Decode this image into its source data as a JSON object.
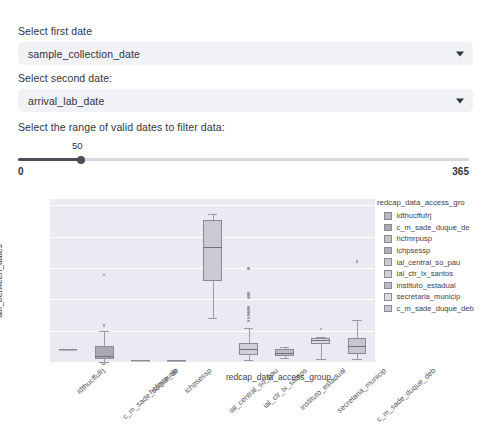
{
  "controls": {
    "first_date": {
      "label": "Select first date",
      "value": "sample_collection_date",
      "chevron_icon": "chevron-down-icon"
    },
    "second_date": {
      "label": "Select second date:",
      "value": "arrival_lab_date",
      "chevron_icon": "chevron-down-icon"
    },
    "range": {
      "label": "Select the range of valid dates to filter data:",
      "value": "50",
      "min": "0",
      "max": "365"
    }
  },
  "chart_data": {
    "type": "box",
    "title": "",
    "xlabel": "redcap_data_access_group",
    "ylabel": "diff_between_dates",
    "ylim": [
      0,
      52
    ],
    "yticks": [
      0,
      10,
      20,
      30,
      40,
      50
    ],
    "grid": true,
    "legend_title": "redcap_data_access_gro",
    "legend_position": "right",
    "categories": [
      "idthucffufrj",
      "c_m_sade_duque_de",
      "hcfmrpusp",
      "ichpsessp",
      "ial_central_so_pau",
      "ial_ctr_lx_santos",
      "instituto_estadual",
      "secretaria_municip",
      "c_m_sade_duque_deb"
    ],
    "boxes": [
      {
        "label": "idthucffufrj",
        "q1": 4.0,
        "median": 4.0,
        "q3": 4.0,
        "whisker_low": 4.0,
        "whisker_high": 4.0,
        "fliers": [],
        "color": "#b8b8c2"
      },
      {
        "label": "c_m_sade_duque_de",
        "q1": 0.8,
        "median": 2.0,
        "q3": 5.0,
        "whisker_low": 0.0,
        "whisker_high": 10.0,
        "fliers": [
          11.7,
          27.8
        ],
        "color": "#a9a9b4"
      },
      {
        "label": "hcfmrpusp",
        "q1": 0.5,
        "median": 0.5,
        "q3": 0.5,
        "whisker_low": 0.5,
        "whisker_high": 0.5,
        "fliers": [],
        "color": "#c2c2cb"
      },
      {
        "label": "ichpsessp",
        "q1": 0.5,
        "median": 0.5,
        "q3": 0.5,
        "whisker_low": 0.5,
        "whisker_high": 0.5,
        "fliers": [],
        "color": "#b0b0bb"
      },
      {
        "label": "ial_central_so_pau",
        "q1": 25.8,
        "median": 36.8,
        "q3": 45.2,
        "whisker_low": 14.0,
        "whisker_high": 47.3,
        "fliers": [],
        "color": "#cacad2"
      },
      {
        "label": "ial_ctr_lx_santos",
        "q1": 2.2,
        "median": 4.0,
        "q3": 6.0,
        "whisker_low": 0.5,
        "whisker_high": 11.0,
        "fliers": [
          13.0,
          14.0,
          15.0,
          15.8,
          16.6,
          17.4,
          20.5,
          21.2,
          21.9,
          29.8
        ],
        "color": "#d0d0d8"
      },
      {
        "label": "instituto_estadual",
        "q1": 2.0,
        "median": 3.0,
        "q3": 4.2,
        "whisker_low": 1.2,
        "whisker_high": 4.8,
        "fliers": [],
        "color": "#bcbcc6"
      },
      {
        "label": "secretaria_municip",
        "q1": 5.8,
        "median": 7.0,
        "q3": 7.6,
        "whisker_low": 1.0,
        "whisker_high": 8.0,
        "fliers": [
          10.5
        ],
        "color": "#dcdce2"
      },
      {
        "label": "c_m_sade_duque_deb",
        "q1": 2.6,
        "median": 5.0,
        "q3": 7.8,
        "whisker_low": 0.8,
        "whisker_high": 13.5,
        "fliers": [
          32.0
        ],
        "color": "#c6c6ce"
      }
    ],
    "legend_entries": [
      {
        "label": "idthucffufrj",
        "color": "#b8b8c2"
      },
      {
        "label": "c_m_sade_duque_de",
        "color": "#a9a9b4"
      },
      {
        "label": "hcfmrpusp",
        "color": "#c2c2cb"
      },
      {
        "label": "ichpsessp",
        "color": "#b0b0bb"
      },
      {
        "label": "ial_central_so_pau",
        "color": "#cacad2"
      },
      {
        "label": "ial_ctr_lx_santos",
        "color": "#d0d0d8"
      },
      {
        "label": "instituto_estadual",
        "color": "#bcbcc6"
      },
      {
        "label": "secretaria_municip",
        "color": "#dcdce2"
      },
      {
        "label": "c_m_sade_duque_deb",
        "color": "#c6c6ce"
      }
    ]
  }
}
